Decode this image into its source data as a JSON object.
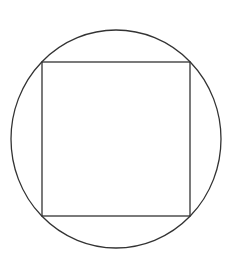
{
  "diagram": {
    "stroke_color": "#333333",
    "background": "#ffffff",
    "circle": {
      "cx": 116,
      "cy": 139,
      "rx": 105,
      "ry": 109
    },
    "square": {
      "x": 42,
      "y": 62,
      "width": 148,
      "height": 154
    }
  }
}
